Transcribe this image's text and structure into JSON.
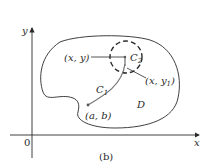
{
  "figure": {
    "caption": "(b)",
    "axes": {
      "x_label": "x",
      "y_label": "y",
      "origin_label": "0"
    },
    "region_label": "D",
    "points": {
      "start": "(a, b)",
      "point_xy": "(x, y)",
      "point_xy1_main": "(x, y",
      "point_xy1_sub": "1",
      "point_xy1_close": ")"
    },
    "curves": {
      "c1_main": "C",
      "c1_sub": "1",
      "c2_main": "C",
      "c2_sub": "2"
    },
    "colors": {
      "stroke": "#2a2a2a",
      "curve": "#777777"
    }
  }
}
